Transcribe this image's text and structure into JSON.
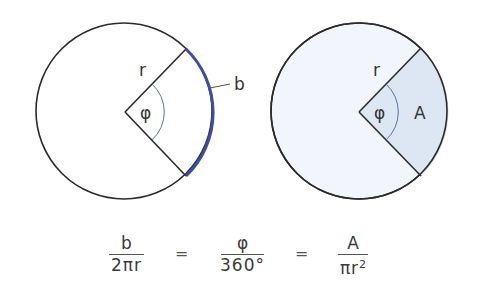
{
  "colors": {
    "outline": "#2b2b2b",
    "arc_highlight": "#3b4f9e",
    "angle_arc": "#5a6fa8",
    "circle_fill_right": "#f2f5fb",
    "sector_fill": "#dde6f3",
    "text": "#3a3a3a"
  },
  "left_figure": {
    "radius_label": "r",
    "angle_label": "φ",
    "arc_label": "b"
  },
  "right_figure": {
    "radius_label": "r",
    "angle_label": "φ",
    "area_label": "A"
  },
  "equation": {
    "fraction_1": {
      "numerator": "b",
      "denominator": "2πr"
    },
    "equals_1": "=",
    "fraction_2": {
      "numerator": "φ",
      "denominator": "360°"
    },
    "equals_2": "=",
    "fraction_3": {
      "numerator": "A",
      "denominator_base": "πr",
      "denominator_exp": "2"
    }
  }
}
